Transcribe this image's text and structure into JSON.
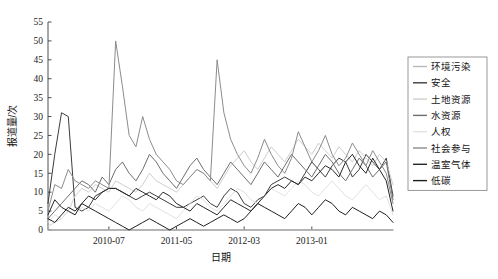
{
  "chart_data": {
    "type": "line",
    "title": "",
    "xlabel": "日期",
    "ylabel": "报道量/次",
    "ylim": [
      0,
      55
    ],
    "yticks": [
      0,
      5,
      10,
      15,
      20,
      25,
      30,
      35,
      40,
      45,
      50,
      55
    ],
    "grid": false,
    "legend_position": "right-outside",
    "xticks": [
      "2010-07",
      "2011-05",
      "2012-03",
      "2013-01"
    ],
    "xtick_index": [
      9,
      19,
      29,
      39
    ],
    "x_count": 52,
    "x_start": "2009-10",
    "series": [
      {
        "name": "环境污染",
        "color": "#b9b9b9",
        "values": [
          0,
          0,
          0,
          0,
          0,
          0,
          0,
          0,
          0,
          0,
          0,
          0,
          0,
          0,
          0,
          0,
          0,
          0,
          0,
          0,
          0,
          0,
          0,
          0,
          0,
          0,
          0,
          0,
          0,
          0,
          0,
          0,
          0,
          0,
          0,
          0,
          0,
          0,
          0,
          0,
          0,
          0,
          0,
          0,
          0,
          0,
          0,
          0,
          0,
          0,
          0,
          0
        ]
      },
      {
        "name": "安全",
        "color": "#3c3c3c",
        "values": [
          7,
          20,
          31,
          30,
          6,
          5,
          6,
          9,
          10,
          11,
          11,
          10,
          9,
          8,
          9,
          10,
          9,
          8,
          7,
          6,
          6,
          7,
          8,
          9,
          7,
          6,
          9,
          11,
          10,
          7,
          6,
          8,
          9,
          12,
          13,
          14,
          13,
          12,
          15,
          18,
          16,
          14,
          17,
          19,
          18,
          14,
          16,
          20,
          18,
          16,
          19,
          9
        ]
      },
      {
        "name": "土地资源",
        "color": "#cfcfcf",
        "values": [
          1,
          2,
          3,
          5,
          9,
          11,
          10,
          12,
          11,
          10,
          13,
          12,
          11,
          10,
          12,
          15,
          13,
          12,
          11,
          10,
          12,
          14,
          16,
          15,
          13,
          11,
          14,
          17,
          19,
          21,
          18,
          16,
          19,
          22,
          20,
          18,
          21,
          24,
          22,
          20,
          23,
          21,
          19,
          22,
          20,
          18,
          21,
          19,
          17,
          20,
          18,
          12
        ]
      },
      {
        "name": "水资源",
        "color": "#6e6e6e",
        "values": [
          3,
          5,
          7,
          9,
          11,
          13,
          12,
          10,
          14,
          12,
          16,
          18,
          15,
          13,
          16,
          20,
          18,
          15,
          13,
          11,
          14,
          17,
          19,
          16,
          14,
          12,
          15,
          18,
          16,
          14,
          12,
          15,
          18,
          16,
          14,
          17,
          20,
          18,
          16,
          14,
          17,
          20,
          18,
          15,
          13,
          16,
          19,
          17,
          14,
          16,
          18,
          8
        ]
      },
      {
        "name": "人权",
        "color": "#e2e2e2",
        "values": [
          2,
          4,
          3,
          5,
          4,
          6,
          5,
          7,
          6,
          5,
          7,
          9,
          8,
          6,
          5,
          7,
          6,
          5,
          4,
          3,
          5,
          7,
          9,
          8,
          6,
          5,
          7,
          9,
          11,
          10,
          8,
          7,
          9,
          11,
          10,
          9,
          11,
          13,
          12,
          10,
          9,
          11,
          13,
          11,
          9,
          8,
          10,
          12,
          10,
          8,
          9,
          4
        ]
      },
      {
        "name": "社会参与",
        "color": "#8c8c8c",
        "values": [
          5,
          12,
          11,
          16,
          13,
          12,
          11,
          13,
          12,
          11,
          50,
          38,
          25,
          22,
          30,
          24,
          20,
          18,
          16,
          13,
          12,
          14,
          16,
          15,
          13,
          45,
          31,
          24,
          20,
          17,
          15,
          19,
          24,
          20,
          17,
          15,
          19,
          26,
          22,
          18,
          21,
          25,
          20,
          17,
          19,
          23,
          20,
          17,
          21,
          18,
          15,
          7
        ]
      },
      {
        "name": "温室气体",
        "color": "#262626",
        "values": [
          4,
          8,
          6,
          5,
          4,
          7,
          9,
          8,
          10,
          11,
          11,
          10,
          9,
          11,
          10,
          9,
          8,
          10,
          9,
          7,
          6,
          5,
          7,
          6,
          5,
          4,
          6,
          8,
          7,
          6,
          5,
          7,
          9,
          11,
          12,
          11,
          13,
          12,
          14,
          13,
          15,
          17,
          16,
          14,
          18,
          20,
          17,
          15,
          19,
          16,
          13,
          5
        ]
      },
      {
        "name": "低碳",
        "color": "#1f1f1f",
        "values": [
          3,
          2,
          4,
          6,
          5,
          7,
          6,
          5,
          4,
          3,
          2,
          1,
          0,
          1,
          2,
          3,
          2,
          1,
          0,
          1,
          2,
          3,
          2,
          1,
          2,
          3,
          4,
          3,
          2,
          3,
          5,
          7,
          6,
          5,
          4,
          3,
          5,
          7,
          6,
          4,
          6,
          8,
          7,
          5,
          4,
          6,
          5,
          4,
          3,
          5,
          4,
          2
        ]
      }
    ]
  }
}
